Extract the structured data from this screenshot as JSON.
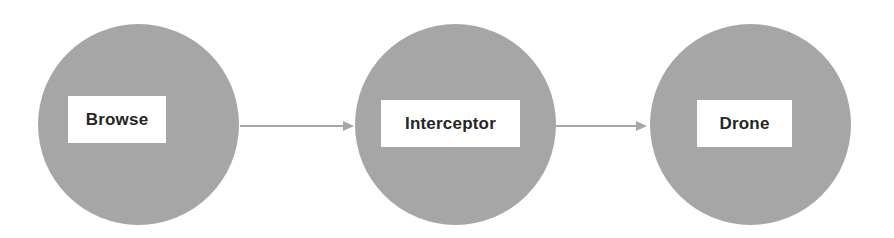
{
  "diagram": {
    "type": "flow-diagram",
    "canvas": {
      "width": 894,
      "height": 238,
      "background_color": "#ffffff"
    },
    "style": {
      "node_fill_color": "#a6a6a6",
      "label_box_color": "#ffffff",
      "label_text_color": "#262626",
      "connector_color": "#a6a6a6"
    },
    "nodes": [
      {
        "id": "browse",
        "label": "Browse",
        "shape": "circle",
        "center_x": 138,
        "center_y": 124,
        "diameter": 201,
        "label_box": {
          "x": 68,
          "y": 96,
          "width": 98,
          "height": 47
        }
      },
      {
        "id": "interceptor",
        "label": "Interceptor",
        "shape": "circle",
        "center_x": 455,
        "center_y": 124,
        "diameter": 201,
        "label_box": {
          "x": 381,
          "y": 100,
          "width": 139,
          "height": 47
        }
      },
      {
        "id": "drone",
        "label": "Drone",
        "shape": "circle",
        "center_x": 750,
        "center_y": 124,
        "diameter": 201,
        "label_box": {
          "x": 697,
          "y": 100,
          "width": 95,
          "height": 47
        }
      }
    ],
    "connectors": [
      {
        "id": "browse-to-interceptor",
        "from": "browse",
        "to": "interceptor",
        "arrowhead": "filled-triangle",
        "x1": 240,
        "y1": 126,
        "x2": 354,
        "y2": 126
      },
      {
        "id": "interceptor-to-drone",
        "from": "interceptor",
        "to": "drone",
        "arrowhead": "filled-triangle",
        "x1": 556,
        "y1": 126,
        "x2": 647,
        "y2": 126
      }
    ]
  }
}
